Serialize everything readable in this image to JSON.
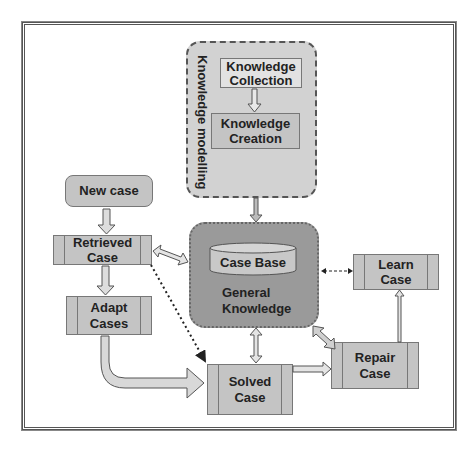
{
  "diagram": {
    "knowledge_modelling": {
      "group_label": "Knowledge modelling",
      "collection_label_1": "Knowledge",
      "collection_label_2": "Collection",
      "creation_label_1": "Knowledge",
      "creation_label_2": "Creation"
    },
    "knowledge_base": {
      "case_base_label": "Case Base",
      "general_label_1": "General",
      "general_label_2": "Knowledge"
    },
    "nodes": {
      "new_case": "New case",
      "retrieved_1": "Retrieved",
      "retrieved_2": "Case",
      "adapt_1": "Adapt",
      "adapt_2": "Cases",
      "solved_1": "Solved",
      "solved_2": "Case",
      "repair_1": "Repair",
      "repair_2": "Case",
      "learn_1": "Learn",
      "learn_2": "Case"
    },
    "colors": {
      "box_fill": "#c4c4c4",
      "group_fill": "#d2d2d2",
      "kb_fill": "#9a9a9a",
      "border": "#555555"
    }
  }
}
